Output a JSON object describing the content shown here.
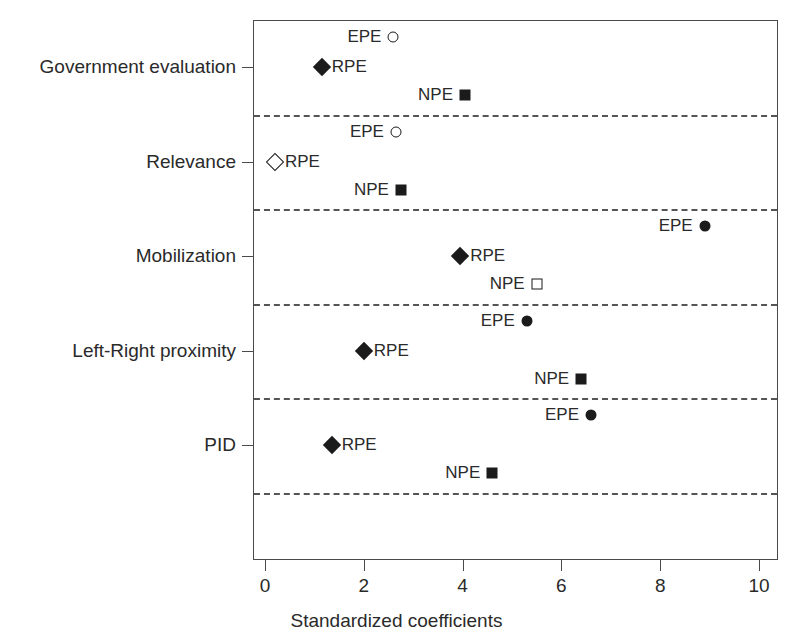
{
  "chart_data": {
    "type": "scatter",
    "title": "",
    "xlabel": "Standardized coefficients",
    "ylabel": "",
    "xlim": [
      0,
      10
    ],
    "xticks": [
      0,
      2,
      4,
      6,
      8,
      10
    ],
    "xtick_labels": [
      "0",
      "2",
      "4",
      "6",
      "8",
      "10"
    ],
    "grid": false,
    "legend": "none",
    "legend_entries": [],
    "categories": [
      "Government evaluation",
      "Relevance",
      "Mobilization",
      "Left-Right proximity",
      "PID"
    ],
    "series": [
      {
        "name": "EPE",
        "values": [
          2.6,
          2.65,
          8.9,
          5.3,
          6.6
        ]
      },
      {
        "name": "RPE",
        "values": [
          1.15,
          0.2,
          3.95,
          2.0,
          1.35
        ]
      },
      {
        "name": "NPE",
        "values": [
          4.05,
          2.75,
          5.5,
          6.4,
          4.6
        ]
      }
    ],
    "points": [
      {
        "category": "Government evaluation",
        "series": "EPE",
        "label": "EPE",
        "value": 2.6,
        "marker": "circle-open",
        "label_side": "left",
        "row": 0
      },
      {
        "category": "Government evaluation",
        "series": "RPE",
        "label": "RPE",
        "value": 1.15,
        "marker": "diamond-filled",
        "label_side": "right",
        "row": 1
      },
      {
        "category": "Government evaluation",
        "series": "NPE",
        "label": "NPE",
        "value": 4.05,
        "marker": "square-filled",
        "label_side": "left",
        "row": 2
      },
      {
        "category": "Relevance",
        "series": "EPE",
        "label": "EPE",
        "value": 2.65,
        "marker": "circle-open",
        "label_side": "left",
        "row": 0
      },
      {
        "category": "Relevance",
        "series": "RPE",
        "label": "RPE",
        "value": 0.2,
        "marker": "diamond-open",
        "label_side": "right",
        "row": 1
      },
      {
        "category": "Relevance",
        "series": "NPE",
        "label": "NPE",
        "value": 2.75,
        "marker": "square-filled",
        "label_side": "left",
        "row": 2
      },
      {
        "category": "Mobilization",
        "series": "EPE",
        "label": "EPE",
        "value": 8.9,
        "marker": "circle-filled",
        "label_side": "left",
        "row": 0
      },
      {
        "category": "Mobilization",
        "series": "RPE",
        "label": "RPE",
        "value": 3.95,
        "marker": "diamond-filled",
        "label_side": "right",
        "row": 1
      },
      {
        "category": "Mobilization",
        "series": "NPE",
        "label": "NPE",
        "value": 5.5,
        "marker": "square-open",
        "label_side": "left",
        "row": 2
      },
      {
        "category": "Left-Right proximity",
        "series": "EPE",
        "label": "EPE",
        "value": 5.3,
        "marker": "circle-filled",
        "label_side": "left",
        "row": 0
      },
      {
        "category": "Left-Right proximity",
        "series": "RPE",
        "label": "RPE",
        "value": 2.0,
        "marker": "diamond-filled",
        "label_side": "right",
        "row": 1
      },
      {
        "category": "Left-Right proximity",
        "series": "NPE",
        "label": "NPE",
        "value": 6.4,
        "marker": "square-filled",
        "label_side": "left",
        "row": 2
      },
      {
        "category": "PID",
        "series": "EPE",
        "label": "EPE",
        "value": 6.6,
        "marker": "circle-filled",
        "label_side": "left",
        "row": 0
      },
      {
        "category": "PID",
        "series": "RPE",
        "label": "RPE",
        "value": 1.35,
        "marker": "diamond-filled",
        "label_side": "right",
        "row": 1
      },
      {
        "category": "PID",
        "series": "NPE",
        "label": "NPE",
        "value": 4.6,
        "marker": "square-filled",
        "label_side": "left",
        "row": 2
      }
    ],
    "separators": [
      1,
      2,
      3,
      4,
      5
    ],
    "marker_colors": {
      "fill": "#1b1b1b",
      "open_fill": "#ffffff",
      "stroke": "#1b1b1b"
    },
    "axis_color": "#4a4a4a",
    "separator_color": "#555555"
  }
}
